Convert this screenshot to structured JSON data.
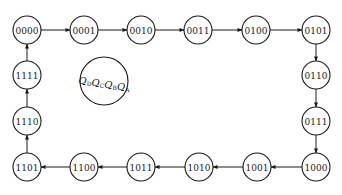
{
  "diagram": {
    "type": "state-transition",
    "legend": {
      "vars": [
        {
          "name": "Q",
          "sub": "D"
        },
        {
          "name": "Q",
          "sub": "C"
        },
        {
          "name": "Q",
          "sub": "B"
        },
        {
          "name": "Q",
          "sub": "A"
        }
      ]
    },
    "states": [
      {
        "label": "0000",
        "x": 27,
        "y": 30
      },
      {
        "label": "0001",
        "x": 84,
        "y": 30
      },
      {
        "label": "0010",
        "x": 141,
        "y": 30
      },
      {
        "label": "0011",
        "x": 198,
        "y": 30
      },
      {
        "label": "0100",
        "x": 256,
        "y": 30
      },
      {
        "label": "0101",
        "x": 316,
        "y": 30
      },
      {
        "label": "0110",
        "x": 316,
        "y": 75
      },
      {
        "label": "0111",
        "x": 316,
        "y": 121
      },
      {
        "label": "1000",
        "x": 316,
        "y": 167
      },
      {
        "label": "1001",
        "x": 257,
        "y": 167
      },
      {
        "label": "1010",
        "x": 199,
        "y": 167
      },
      {
        "label": "1011",
        "x": 141,
        "y": 167
      },
      {
        "label": "1100",
        "x": 84,
        "y": 167
      },
      {
        "label": "1101",
        "x": 27,
        "y": 167
      },
      {
        "label": "1110",
        "x": 27,
        "y": 121
      },
      {
        "label": "1111",
        "x": 27,
        "y": 75
      }
    ],
    "transitions": "each state -> next state in list, last (1111) -> first (0000)"
  }
}
